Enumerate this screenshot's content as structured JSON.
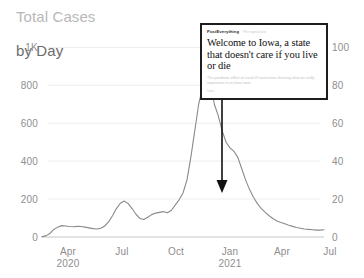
{
  "chart_data": {
    "type": "line",
    "title": "Total Cases\nby Day",
    "title_line1": "Total Cases",
    "title_line2": "by Day",
    "xlabel": "",
    "ylabel": "",
    "grid": true,
    "legend": null,
    "x_tick_labels": [
      "Apr",
      "Jul",
      "Oct",
      "Jan",
      "Apr",
      "Jul"
    ],
    "x_tick_sublabels": [
      "2020",
      "",
      "",
      "2021",
      "",
      ""
    ],
    "y_left_ticks": [
      "0",
      "200",
      "400",
      "600",
      "800",
      "1K"
    ],
    "y_left_values": [
      0,
      200,
      400,
      600,
      800,
      1000
    ],
    "y_left_lim": [
      0,
      1000
    ],
    "y_right_ticks": [
      "0",
      "20",
      "40",
      "60",
      "80",
      "100"
    ],
    "y_right_values": [
      0,
      20,
      40,
      60,
      80,
      100
    ],
    "y_right_lim": [
      0,
      100
    ],
    "line_color": "#8a8a8a",
    "series": [
      {
        "name": "cases-per-day",
        "axis": "left",
        "x": [
          "2020-03-15",
          "2020-03-22",
          "2020-03-29",
          "2020-04-05",
          "2020-04-12",
          "2020-04-19",
          "2020-04-26",
          "2020-05-03",
          "2020-05-10",
          "2020-05-17",
          "2020-05-24",
          "2020-05-31",
          "2020-06-07",
          "2020-06-14",
          "2020-06-21",
          "2020-06-28",
          "2020-07-05",
          "2020-07-12",
          "2020-07-19",
          "2020-07-26",
          "2020-08-02",
          "2020-08-09",
          "2020-08-16",
          "2020-08-23",
          "2020-08-30",
          "2020-09-06",
          "2020-09-13",
          "2020-09-20",
          "2020-09-27",
          "2020-10-04",
          "2020-10-11",
          "2020-10-18",
          "2020-10-25",
          "2020-11-01",
          "2020-11-08",
          "2020-11-15",
          "2020-11-22",
          "2020-11-29",
          "2020-12-06",
          "2020-12-13",
          "2020-12-20",
          "2020-12-27",
          "2021-01-03",
          "2021-01-10",
          "2021-01-17",
          "2021-01-24",
          "2021-01-31",
          "2021-02-07",
          "2021-02-14",
          "2021-02-21",
          "2021-02-28",
          "2021-03-07",
          "2021-03-14",
          "2021-03-21",
          "2021-03-28",
          "2021-04-04",
          "2021-04-11",
          "2021-04-18",
          "2021-04-25",
          "2021-05-02",
          "2021-05-09",
          "2021-05-16",
          "2021-05-23",
          "2021-05-30",
          "2021-06-06",
          "2021-06-13",
          "2021-06-20",
          "2021-06-27",
          "2021-07-04",
          "2021-07-11",
          "2021-07-18",
          "2021-07-25",
          "2021-08-01"
        ],
        "values": [
          2,
          6,
          18,
          40,
          52,
          60,
          58,
          55,
          54,
          56,
          55,
          52,
          48,
          44,
          42,
          46,
          58,
          80,
          112,
          150,
          178,
          190,
          176,
          150,
          120,
          98,
          92,
          104,
          118,
          126,
          130,
          134,
          128,
          140,
          168,
          196,
          232,
          300,
          420,
          560,
          700,
          790,
          846,
          820,
          700,
          640,
          560,
          500,
          470,
          452,
          420,
          360,
          300,
          250,
          210,
          176,
          150,
          130,
          112,
          96,
          84,
          76,
          70,
          62,
          56,
          50,
          46,
          42,
          40,
          38,
          36,
          36,
          38
        ]
      }
    ],
    "annotations": [
      {
        "type": "arrow",
        "direction": "down",
        "from_x": "2021-01-24",
        "points_to_series": "cases-per-day"
      }
    ]
  },
  "annotation_card": {
    "kicker": "PostEverything",
    "kicker_separator": "·",
    "kicker_tag": "Perspective",
    "headline": "Welcome to Iowa, a state that doesn't care if you live or die",
    "subhead": "The pandemic effect of covid-19 restrictions showing what we really experience in an Iowa town.",
    "byline": "Iowa"
  }
}
